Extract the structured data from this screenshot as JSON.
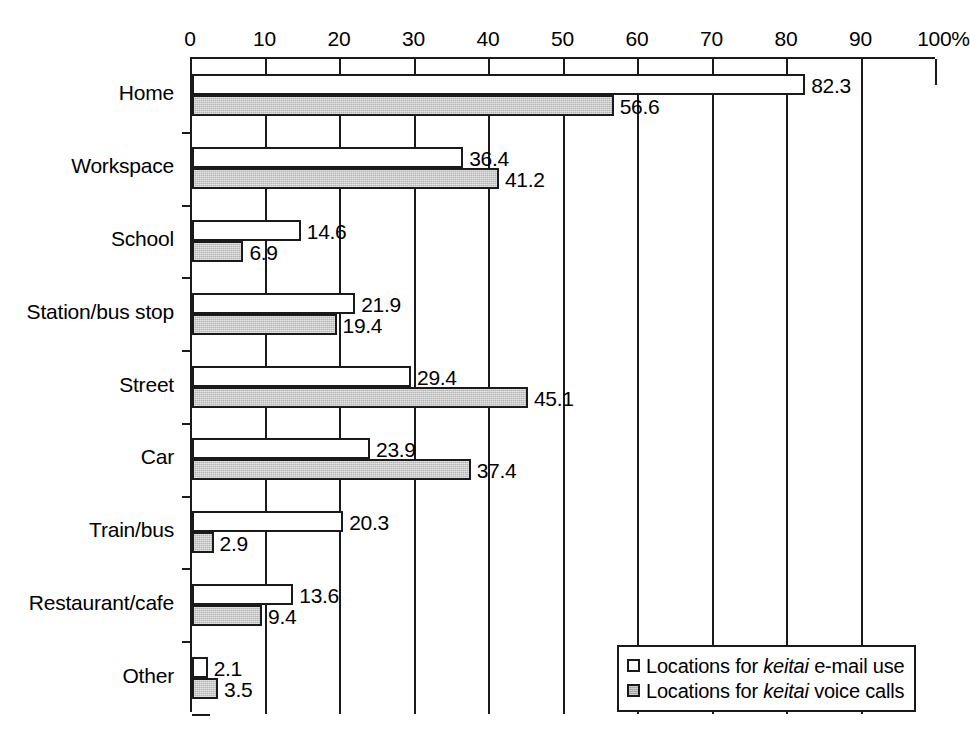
{
  "chart_data": {
    "type": "bar",
    "orientation": "horizontal",
    "title": "",
    "xlabel": "",
    "ylabel": "",
    "xlim": [
      0,
      100
    ],
    "grid": true,
    "legend_position": "bottom-right",
    "x_unit_suffix": "%",
    "xticks": [
      "0",
      "10",
      "20",
      "30",
      "40",
      "50",
      "60",
      "70",
      "80",
      "90",
      "100%"
    ],
    "xtick_values": [
      0,
      10,
      20,
      30,
      40,
      50,
      60,
      70,
      80,
      90,
      100
    ],
    "categories": [
      "Home",
      "Workspace",
      "School",
      "Station/bus stop",
      "Street",
      "Car",
      "Train/bus",
      "Restaurant/cafe",
      "Other"
    ],
    "series": [
      {
        "name": "Locations for keitai e-mail use",
        "style": "white",
        "values": [
          82.3,
          36.4,
          14.6,
          21.9,
          29.4,
          23.9,
          20.3,
          13.6,
          2.1
        ],
        "labels": [
          "82.3",
          "36.4",
          "14.6",
          "21.9",
          "29.4",
          "23.9",
          "20.3",
          "13.6",
          "2.1"
        ]
      },
      {
        "name": "Locations for keitai voice calls",
        "style": "gray",
        "values": [
          56.6,
          41.2,
          6.9,
          19.4,
          45.1,
          37.4,
          2.9,
          9.4,
          3.5
        ],
        "labels": [
          "56.6",
          "41.2",
          "6.9",
          "19.4",
          "45.1",
          "37.4",
          "2.9",
          "9.4",
          "3.5"
        ]
      }
    ]
  },
  "legend": {
    "items": [
      {
        "prefix": "Locations for ",
        "italic": "keitai",
        "suffix": " e-mail use",
        "swatch": "white"
      },
      {
        "prefix": "Locations for ",
        "italic": "keitai",
        "suffix": " voice calls",
        "swatch": "gray"
      }
    ]
  },
  "colors": {
    "bar_email_fill": "#ffffff",
    "bar_voice_fill": "#b4b4b4",
    "outline": "#1a1a1a",
    "background": "#ffffff"
  }
}
